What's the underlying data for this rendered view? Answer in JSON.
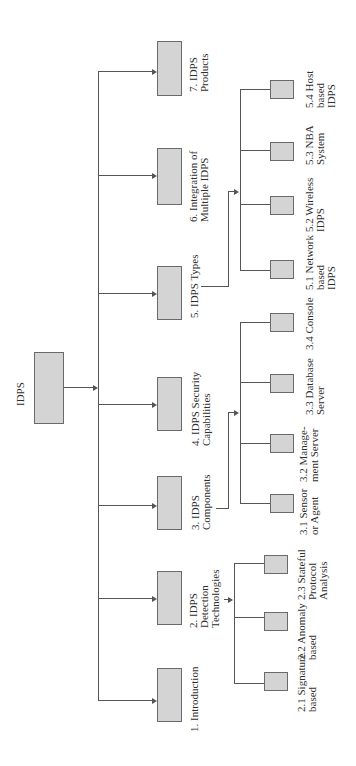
{
  "diagram": {
    "type": "tree",
    "orientation": "rotated-90",
    "root": {
      "label": "IDPS"
    },
    "sections": [
      {
        "id": "1",
        "label": "1. Introduction",
        "children": []
      },
      {
        "id": "2",
        "label": "2. IDPS\nDetection\nTechnologies",
        "children": [
          {
            "id": "2.1",
            "label": "2.1 Signature\nbased"
          },
          {
            "id": "2.2",
            "label": "2.2 Anomaly\nbased"
          },
          {
            "id": "2.3",
            "label": "2.3 Stateful\nProtocol\nAnalysis"
          }
        ]
      },
      {
        "id": "3",
        "label": "3. IDPS\nComponents",
        "children": [
          {
            "id": "3.1",
            "label": "3.1 Sensor\nor Agent"
          },
          {
            "id": "3.2",
            "label": "3.2 Manage-\nment Server"
          },
          {
            "id": "3.3",
            "label": "3.3 Database\nServer"
          },
          {
            "id": "3.4",
            "label": "3.4 Console"
          }
        ]
      },
      {
        "id": "4",
        "label": "4. IDPS Security\nCapabilities",
        "children": []
      },
      {
        "id": "5",
        "label": "5. IDPS Types",
        "children": [
          {
            "id": "5.1",
            "label": "5.1 Network\nbased\nIDPS"
          },
          {
            "id": "5.2",
            "label": "5.2 Wireless\nIDPS"
          },
          {
            "id": "5.3",
            "label": "5.3 NBA\nSystem"
          },
          {
            "id": "5.4",
            "label": "5.4 Host\nbased\nIDPS"
          }
        ]
      },
      {
        "id": "6",
        "label": "6. Integration of\nMultiple IDPS",
        "children": []
      },
      {
        "id": "7",
        "label": "7. IDPS\nProducts",
        "children": []
      }
    ]
  },
  "colors": {
    "box_fill": "#d4d4d4",
    "box_border": "#6a6a6a",
    "line": "#555555",
    "background": "#ffffff"
  }
}
